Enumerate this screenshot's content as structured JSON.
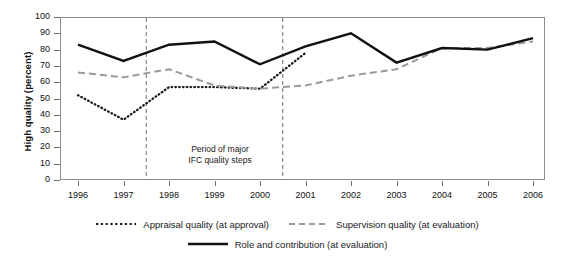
{
  "chart_data": {
    "type": "line",
    "title": "",
    "xlabel": "",
    "ylabel": "High quality (percent)",
    "categories": [
      "1996",
      "1997",
      "1998",
      "1999",
      "2000",
      "2001",
      "2002",
      "2003",
      "2004",
      "2005",
      "2006"
    ],
    "x": [
      1996,
      1997,
      1998,
      1999,
      2000,
      2001,
      2002,
      2003,
      2004,
      2005,
      2006
    ],
    "ylim": [
      0,
      100
    ],
    "yticks": [
      0,
      10,
      20,
      30,
      40,
      50,
      60,
      70,
      80,
      90,
      100
    ],
    "grid": false,
    "legend_position": "bottom",
    "series": [
      {
        "name": "Appraisal quality (at approval)",
        "style": "dotted",
        "color": "#1a1a1a",
        "values": [
          52,
          37,
          57,
          57,
          56,
          78,
          null,
          null,
          null,
          null,
          null
        ]
      },
      {
        "name": "Supervision quality (at evaluation)",
        "style": "dashed",
        "color": "#9a9a9a",
        "values": [
          66,
          63,
          68,
          58,
          56,
          58,
          64,
          68,
          81,
          81,
          85
        ]
      },
      {
        "name": "Role and contribution (at evaluation)",
        "style": "solid",
        "color": "#111111",
        "values": [
          83,
          73,
          83,
          85,
          71,
          82,
          90,
          72,
          81,
          80,
          87
        ]
      }
    ],
    "annotations": [
      {
        "text_line1": "Period of major",
        "text_line2": "IFC quality steps",
        "vline_start": 1997.5,
        "vline_end": 2000.5
      }
    ]
  },
  "axis": {
    "y_title": "High quality (percent)",
    "y_tick_labels": [
      "100",
      "90",
      "80",
      "70",
      "60",
      "50",
      "40",
      "30",
      "20",
      "10",
      "0"
    ],
    "x_tick_labels": [
      "1996",
      "1997",
      "1998",
      "1999",
      "2000",
      "2001",
      "2002",
      "2003",
      "2004",
      "2005",
      "2006"
    ]
  },
  "annotation": {
    "line1": "Period of major",
    "line2": "IFC quality steps"
  },
  "legend": {
    "items": [
      {
        "label": "Appraisal quality (at approval)",
        "style": "dotted"
      },
      {
        "label": "Supervision quality (at evaluation)",
        "style": "dashed"
      },
      {
        "label": "Role and contribution (at evaluation)",
        "style": "solid"
      }
    ]
  }
}
